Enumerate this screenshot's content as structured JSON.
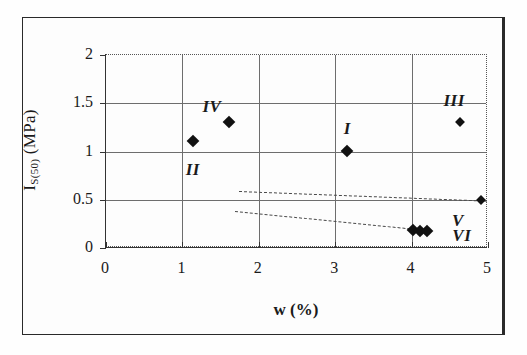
{
  "figure": {
    "background_color": "#fefefe",
    "frame_color": "#2a2a2a"
  },
  "chart_data": {
    "type": "scatter",
    "title": "",
    "xlabel": "w (%)",
    "ylabel_main": "I",
    "ylabel_sub": "S(50)",
    "ylabel_unit": " (MPa)",
    "ylabel_full": "IS(50) (MPa)",
    "xlim": [
      0,
      5
    ],
    "ylim": [
      0,
      2
    ],
    "xticks": [
      "0",
      "1",
      "2",
      "3",
      "4",
      "5"
    ],
    "xtick_values": [
      0,
      1,
      2,
      3,
      4,
      5
    ],
    "yticks": [
      "0",
      "0.5",
      "1",
      "1.5",
      "2"
    ],
    "ytick_values": [
      0,
      0.5,
      1,
      1.5,
      2
    ],
    "grid": "both",
    "legend": "none",
    "marker_color": "#111111",
    "marker_shape": "diamond",
    "points": [
      {
        "label": "II",
        "x": 1.15,
        "y": 1.1,
        "label_dx": 0,
        "label_dy": 0.3,
        "label_anchor": "below"
      },
      {
        "label": "IV",
        "x": 1.62,
        "y": 1.3,
        "label_dx": -0.22,
        "label_dy": -0.15,
        "label_anchor": "above-left"
      },
      {
        "label": "I",
        "x": 3.17,
        "y": 1.0,
        "label_dx": 0,
        "label_dy": -0.22,
        "label_anchor": "above"
      },
      {
        "label": "III",
        "x": 4.65,
        "y": 1.3,
        "label_dx": -0.08,
        "label_dy": -0.21,
        "label_anchor": "above"
      },
      {
        "label": "V",
        "x": 4.92,
        "y": 0.49,
        "label_dx": -0.3,
        "label_dy": 0.22,
        "label_anchor": "below-left"
      },
      {
        "label": "VI",
        "x": 4.12,
        "y": 0.17,
        "label_dx": 0.55,
        "label_dy": 0.06,
        "label_anchor": "right"
      }
    ],
    "cluster_points": [
      {
        "x": 4.03,
        "y": 0.18
      },
      {
        "x": 4.12,
        "y": 0.17
      },
      {
        "x": 4.22,
        "y": 0.17
      }
    ],
    "trendlines": [
      {
        "name": "upper-trend",
        "x1": 1.75,
        "y1": 0.58,
        "x2": 5.0,
        "y2": 0.48,
        "style": "dashed"
      },
      {
        "name": "lower-trend",
        "x1": 1.7,
        "y1": 0.37,
        "x2": 4.25,
        "y2": 0.17,
        "style": "dashed"
      }
    ]
  }
}
